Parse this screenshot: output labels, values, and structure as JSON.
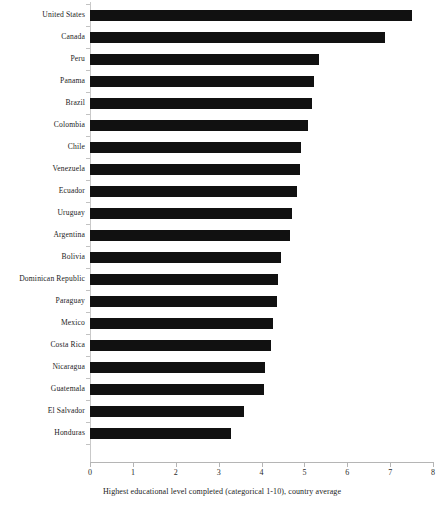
{
  "chart_data": {
    "type": "bar",
    "orientation": "horizontal",
    "title": "",
    "subtitle": "",
    "xlabel": "Highest educational level completed (categorical 1-10), country average",
    "ylabel": "",
    "xlim": [
      0,
      8
    ],
    "xticks": [
      0,
      1,
      2,
      3,
      4,
      5,
      6,
      7,
      8
    ],
    "xtick_labels": [
      "0",
      "1",
      "2",
      "3",
      "4",
      "5",
      "6",
      "7",
      "8"
    ],
    "grid": false,
    "legend": null,
    "bar_color": "#111111",
    "categories": [
      "United States",
      "Canada",
      "Peru",
      "Panama",
      "Brazil",
      "Colombia",
      "Chile",
      "Venezuela",
      "Ecuador",
      "Uruguay",
      "Argentina",
      "Bolivia",
      "Dominican Republic",
      "Paraguay",
      "Mexico",
      "Costa Rica",
      "Nicaragua",
      "Guatemala",
      "El Salvador",
      "Honduras"
    ],
    "values": [
      7.5,
      6.87,
      5.35,
      5.22,
      5.18,
      5.08,
      4.93,
      4.9,
      4.83,
      4.7,
      4.67,
      4.45,
      4.38,
      4.36,
      4.26,
      4.21,
      4.09,
      4.05,
      3.6,
      3.29
    ]
  }
}
